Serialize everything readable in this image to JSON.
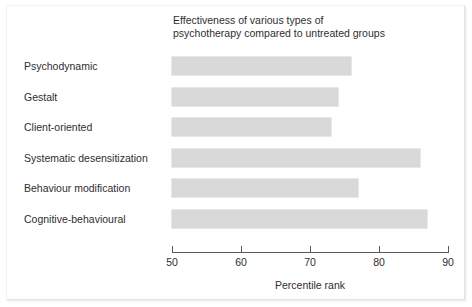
{
  "chart_data": {
    "type": "bar",
    "orientation": "horizontal",
    "title": "Effectiveness of various types of\npsychotherapy compared to untreated groups",
    "xlabel": "Percentile rank",
    "ylabel": "",
    "xlim": [
      50,
      90
    ],
    "xticks": [
      50,
      60,
      70,
      80,
      90
    ],
    "xticklabels": [
      "50",
      "60",
      "70",
      "80",
      "90"
    ],
    "grid": false,
    "legend": false,
    "categories": [
      "Psychodynamic",
      "Gestalt",
      "Client-oriented",
      "Systematic desensitization",
      "Behaviour modification",
      "Cognitive-behavioural"
    ],
    "values": [
      76,
      74,
      73,
      86,
      77,
      87
    ],
    "bar_color": "#d9d9d9",
    "axis_color": "#59595b",
    "text_color": "#2e2e2e",
    "background": "#ffffff"
  }
}
